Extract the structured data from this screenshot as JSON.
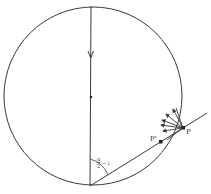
{
  "diagram": {
    "type": "geometric-optics",
    "stroke_color": "#3a3a3a",
    "background": "#ffffff",
    "circle": {
      "cx": 93,
      "cy": 96,
      "r": 89
    },
    "vertical_ray": {
      "x1": 91,
      "y1": 6,
      "x2": 90,
      "y2": 186,
      "arrow_y": 57,
      "center_dot": {
        "x": 91,
        "y": 97
      }
    },
    "oblique_line": {
      "x1": 90,
      "y1": 186,
      "x2": 207,
      "y2": 113
    },
    "points": {
      "P": {
        "label": "P",
        "x": 183,
        "y": 128
      },
      "P_prime": {
        "label": "P'",
        "x": 161,
        "y": 142
      }
    },
    "angle_label": {
      "numerator": "π",
      "denominator": "2",
      "suffix": "− i"
    },
    "fan_arrows_count": 5
  }
}
